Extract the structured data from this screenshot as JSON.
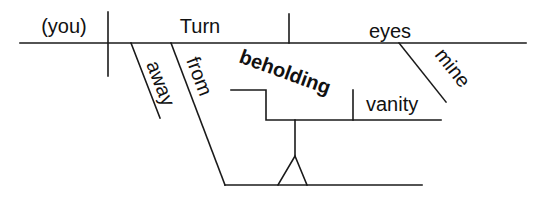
{
  "diagram": {
    "type": "sentence-diagram",
    "sentence": "Turn away mine eyes from beholding vanity",
    "words": {
      "subject": "(you)",
      "verb": "Turn",
      "direct_object": "eyes",
      "object_modifier": "mine",
      "adverb": "away",
      "preposition": "from",
      "gerund": "beholding",
      "gerund_object": "vanity"
    },
    "colors": {
      "line": "#1a1a1a",
      "text": "#111111",
      "background": "#ffffff"
    }
  }
}
